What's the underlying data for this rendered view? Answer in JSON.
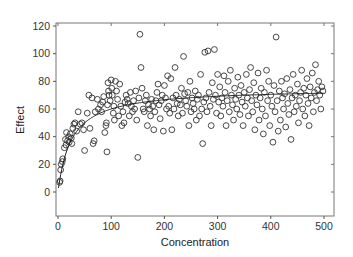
{
  "chart_data": {
    "type": "scatter",
    "title": "",
    "xlabel": "Concentration",
    "ylabel": "Effect",
    "xlim": [
      -5,
      520
    ],
    "ylim": [
      -17,
      121
    ],
    "xticks": [
      0,
      100,
      200,
      300,
      400,
      500
    ],
    "yticks": [
      0,
      20,
      40,
      60,
      80,
      100,
      120
    ],
    "grid": false,
    "legend": "none",
    "marker": "open-circle",
    "colors": {
      "points": "#333333",
      "curve": "#222222",
      "axis": "#555555"
    },
    "fit_curve": {
      "model": "Emax",
      "E0": 0,
      "Emax": 75,
      "EC50": 25,
      "description": "saturating curve rising from ~0 at x=0 to a plateau near 70"
    },
    "points": [
      [
        3,
        7
      ],
      [
        4,
        8
      ],
      [
        5,
        16
      ],
      [
        6,
        20
      ],
      [
        8,
        22
      ],
      [
        9,
        24
      ],
      [
        12,
        32
      ],
      [
        14,
        38
      ],
      [
        15,
        34
      ],
      [
        16,
        43
      ],
      [
        18,
        37
      ],
      [
        20,
        40
      ],
      [
        21,
        36
      ],
      [
        23,
        42
      ],
      [
        25,
        39
      ],
      [
        26,
        35
      ],
      [
        28,
        46
      ],
      [
        30,
        49
      ],
      [
        32,
        50
      ],
      [
        35,
        44
      ],
      [
        38,
        58
      ],
      [
        42,
        49
      ],
      [
        45,
        50
      ],
      [
        48,
        45
      ],
      [
        50,
        30
      ],
      [
        55,
        57
      ],
      [
        58,
        70
      ],
      [
        60,
        46
      ],
      [
        64,
        68
      ],
      [
        66,
        35
      ],
      [
        68,
        37
      ],
      [
        70,
        58
      ],
      [
        74,
        67
      ],
      [
        76,
        60
      ],
      [
        80,
        63
      ],
      [
        82,
        58
      ],
      [
        84,
        65
      ],
      [
        86,
        69
      ],
      [
        88,
        43
      ],
      [
        90,
        48
      ],
      [
        91,
        50
      ],
      [
        92,
        29
      ],
      [
        93,
        63
      ],
      [
        94,
        79
      ],
      [
        95,
        73
      ],
      [
        96,
        70
      ],
      [
        98,
        66
      ],
      [
        100,
        81
      ],
      [
        101,
        75
      ],
      [
        102,
        70
      ],
      [
        104,
        57
      ],
      [
        105,
        62
      ],
      [
        106,
        52
      ],
      [
        108,
        80
      ],
      [
        110,
        73
      ],
      [
        112,
        67
      ],
      [
        114,
        55
      ],
      [
        116,
        78
      ],
      [
        118,
        62
      ],
      [
        120,
        48
      ],
      [
        122,
        58
      ],
      [
        124,
        50
      ],
      [
        126,
        65
      ],
      [
        128,
        70
      ],
      [
        130,
        67
      ],
      [
        132,
        64
      ],
      [
        134,
        55
      ],
      [
        136,
        72
      ],
      [
        138,
        62
      ],
      [
        140,
        58
      ],
      [
        142,
        66
      ],
      [
        144,
        60
      ],
      [
        146,
        73
      ],
      [
        148,
        52
      ],
      [
        150,
        25
      ],
      [
        152,
        68
      ],
      [
        154,
        114
      ],
      [
        156,
        90
      ],
      [
        158,
        75
      ],
      [
        160,
        60
      ],
      [
        162,
        58
      ],
      [
        164,
        66
      ],
      [
        166,
        70
      ],
      [
        168,
        48
      ],
      [
        170,
        63
      ],
      [
        172,
        60
      ],
      [
        174,
        55
      ],
      [
        176,
        67
      ],
      [
        178,
        62
      ],
      [
        180,
        45
      ],
      [
        182,
        58
      ],
      [
        184,
        66
      ],
      [
        186,
        72
      ],
      [
        188,
        78
      ],
      [
        190,
        63
      ],
      [
        192,
        53
      ],
      [
        194,
        66
      ],
      [
        196,
        70
      ],
      [
        198,
        44
      ],
      [
        200,
        77
      ],
      [
        202,
        68
      ],
      [
        204,
        60
      ],
      [
        206,
        84
      ],
      [
        208,
        62
      ],
      [
        210,
        57
      ],
      [
        212,
        82
      ],
      [
        214,
        45
      ],
      [
        216,
        68
      ],
      [
        218,
        60
      ],
      [
        220,
        90
      ],
      [
        222,
        70
      ],
      [
        224,
        64
      ],
      [
        226,
        55
      ],
      [
        228,
        67
      ],
      [
        230,
        63
      ],
      [
        232,
        75
      ],
      [
        234,
        57
      ],
      [
        236,
        98
      ],
      [
        238,
        71
      ],
      [
        240,
        66
      ],
      [
        242,
        62
      ],
      [
        244,
        72
      ],
      [
        246,
        48
      ],
      [
        248,
        80
      ],
      [
        250,
        58
      ],
      [
        252,
        68
      ],
      [
        254,
        64
      ],
      [
        256,
        60
      ],
      [
        258,
        73
      ],
      [
        260,
        52
      ],
      [
        262,
        67
      ],
      [
        264,
        70
      ],
      [
        266,
        55
      ],
      [
        268,
        85
      ],
      [
        270,
        60
      ],
      [
        272,
        35
      ],
      [
        274,
        65
      ],
      [
        276,
        101
      ],
      [
        278,
        68
      ],
      [
        280,
        58
      ],
      [
        282,
        102
      ],
      [
        284,
        72
      ],
      [
        286,
        62
      ],
      [
        288,
        48
      ],
      [
        290,
        79
      ],
      [
        292,
        67
      ],
      [
        294,
        103
      ],
      [
        296,
        70
      ],
      [
        298,
        57
      ],
      [
        300,
        85
      ],
      [
        302,
        65
      ],
      [
        304,
        76
      ],
      [
        306,
        55
      ],
      [
        308,
        68
      ],
      [
        310,
        62
      ],
      [
        312,
        84
      ],
      [
        314,
        72
      ],
      [
        316,
        48
      ],
      [
        318,
        66
      ],
      [
        320,
        80
      ],
      [
        322,
        58
      ],
      [
        324,
        88
      ],
      [
        326,
        70
      ],
      [
        328,
        63
      ],
      [
        330,
        52
      ],
      [
        332,
        75
      ],
      [
        334,
        67
      ],
      [
        336,
        60
      ],
      [
        338,
        83
      ],
      [
        340,
        70
      ],
      [
        342,
        56
      ],
      [
        344,
        77
      ],
      [
        346,
        65
      ],
      [
        348,
        48
      ],
      [
        350,
        72
      ],
      [
        352,
        62
      ],
      [
        354,
        85
      ],
      [
        356,
        68
      ],
      [
        358,
        55
      ],
      [
        360,
        74
      ],
      [
        362,
        90
      ],
      [
        364,
        66
      ],
      [
        366,
        58
      ],
      [
        368,
        79
      ],
      [
        370,
        45
      ],
      [
        372,
        70
      ],
      [
        374,
        63
      ],
      [
        376,
        86
      ],
      [
        378,
        52
      ],
      [
        380,
        68
      ],
      [
        382,
        75
      ],
      [
        384,
        60
      ],
      [
        386,
        42
      ],
      [
        388,
        72
      ],
      [
        390,
        55
      ],
      [
        392,
        88
      ],
      [
        394,
        66
      ],
      [
        396,
        80
      ],
      [
        398,
        48
      ],
      [
        400,
        70
      ],
      [
        402,
        62
      ],
      [
        404,
        36
      ],
      [
        406,
        77
      ],
      [
        408,
        58
      ],
      [
        410,
        112
      ],
      [
        412,
        66
      ],
      [
        414,
        44
      ],
      [
        416,
        73
      ],
      [
        418,
        52
      ],
      [
        420,
        80
      ],
      [
        422,
        68
      ],
      [
        424,
        60
      ],
      [
        426,
        71
      ],
      [
        428,
        47
      ],
      [
        430,
        82
      ],
      [
        432,
        64
      ],
      [
        434,
        56
      ],
      [
        436,
        74
      ],
      [
        438,
        38
      ],
      [
        440,
        68
      ],
      [
        442,
        85
      ],
      [
        444,
        58
      ],
      [
        446,
        70
      ],
      [
        448,
        62
      ],
      [
        450,
        78
      ],
      [
        452,
        50
      ],
      [
        454,
        66
      ],
      [
        456,
        72
      ],
      [
        458,
        88
      ],
      [
        460,
        60
      ],
      [
        462,
        75
      ],
      [
        464,
        55
      ],
      [
        466,
        70
      ],
      [
        468,
        82
      ],
      [
        470,
        64
      ],
      [
        472,
        48
      ],
      [
        474,
        76
      ],
      [
        476,
        68
      ],
      [
        478,
        86
      ],
      [
        480,
        58
      ],
      [
        482,
        72
      ],
      [
        484,
        92
      ],
      [
        486,
        66
      ],
      [
        488,
        74
      ],
      [
        490,
        80
      ],
      [
        492,
        70
      ],
      [
        494,
        60
      ],
      [
        496,
        76
      ],
      [
        498,
        73
      ]
    ]
  }
}
